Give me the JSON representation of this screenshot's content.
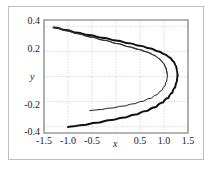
{
  "chart_data": {
    "type": "line",
    "title": "",
    "subtitle": "",
    "xlabel": "x",
    "ylabel": "y",
    "xlim": [
      -1.5,
      1.5
    ],
    "ylim": [
      -0.45,
      0.45
    ],
    "grid": true,
    "grid_style": "dotted",
    "legend": null,
    "legend_position": "none",
    "xticks": [
      -1.5,
      -1.0,
      -0.5,
      0,
      0.5,
      1.0,
      1.5
    ],
    "xticklabels": [
      "-1.5",
      "-1.0",
      "-0.5",
      "x",
      "0.5",
      "1.0",
      "1.5"
    ],
    "yticks": [
      0.4,
      0.2,
      0.0,
      -0.2,
      -0.4
    ],
    "yticklabels": [
      "0.4",
      "0.2",
      "y",
      "-0.2",
      "-0.4"
    ],
    "series": [
      {
        "name": "outer-branch-upper",
        "linewidth": 2.0,
        "color": "#111111",
        "x": [
          -1.3,
          -1.1,
          -0.88,
          -0.62,
          -0.34,
          -0.05,
          0.22,
          0.45,
          0.66,
          0.84,
          0.99,
          1.1,
          1.18,
          1.235,
          1.268,
          1.283
        ],
        "y": [
          0.39,
          0.372,
          0.353,
          0.332,
          0.31,
          0.288,
          0.266,
          0.246,
          0.226,
          0.204,
          0.18,
          0.154,
          0.124,
          0.092,
          0.05,
          0.005
        ]
      },
      {
        "name": "outer-branch-lower",
        "linewidth": 2.0,
        "color": "#111111",
        "x": [
          1.283,
          1.268,
          1.232,
          1.172,
          1.09,
          0.98,
          0.84,
          0.66,
          0.45,
          0.22,
          -0.05,
          -0.34,
          -0.62,
          -0.88,
          -1.0
        ],
        "y": [
          0.005,
          -0.042,
          -0.088,
          -0.132,
          -0.172,
          -0.208,
          -0.242,
          -0.272,
          -0.3,
          -0.324,
          -0.345,
          -0.366,
          -0.384,
          -0.397,
          -0.402
        ]
      },
      {
        "name": "inner-branch-upper",
        "linewidth": 1.0,
        "color": "#222222",
        "x": [
          -1.3,
          -1.1,
          -0.88,
          -0.62,
          -0.34,
          -0.05,
          0.2,
          0.4,
          0.58,
          0.74,
          0.87,
          0.96,
          1.025,
          1.06,
          1.07
        ],
        "y": [
          0.39,
          0.368,
          0.346,
          0.32,
          0.294,
          0.266,
          0.24,
          0.22,
          0.2,
          0.176,
          0.148,
          0.116,
          0.08,
          0.04,
          0.004
        ]
      },
      {
        "name": "inner-branch-lower",
        "linewidth": 1.0,
        "color": "#222222",
        "x": [
          1.07,
          1.058,
          1.02,
          0.955,
          0.865,
          0.74,
          0.58,
          0.4,
          0.2,
          -0.05,
          -0.3,
          -0.45,
          -0.545
        ],
        "y": [
          0.004,
          -0.036,
          -0.076,
          -0.112,
          -0.144,
          -0.172,
          -0.196,
          -0.216,
          -0.234,
          -0.25,
          -0.263,
          -0.268,
          -0.272
        ]
      },
      {
        "name": "inner-branch-upper-2",
        "linewidth": 1.0,
        "color": "#333333",
        "x": [
          -1.3,
          -1.08,
          -0.84,
          -0.58,
          -0.3,
          -0.02,
          0.24,
          0.46,
          0.64,
          0.79,
          0.9,
          0.985,
          1.035,
          1.062
        ],
        "y": [
          0.39,
          0.366,
          0.342,
          0.316,
          0.29,
          0.264,
          0.238,
          0.216,
          0.194,
          0.168,
          0.138,
          0.104,
          0.064,
          0.022
        ]
      }
    ]
  },
  "figure": {
    "background_color": "#ffffff",
    "frame_color": "#6b6b6b",
    "grid_color": "#b9b9b9",
    "text_color": "#1a1a1a"
  }
}
